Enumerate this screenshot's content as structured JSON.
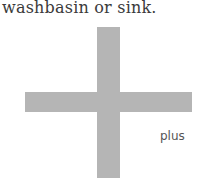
{
  "caption": {
    "text": "washbasin or sink."
  },
  "symbol": {
    "name": "plus-cross",
    "color": "#b5b5b5",
    "label": "plus"
  }
}
